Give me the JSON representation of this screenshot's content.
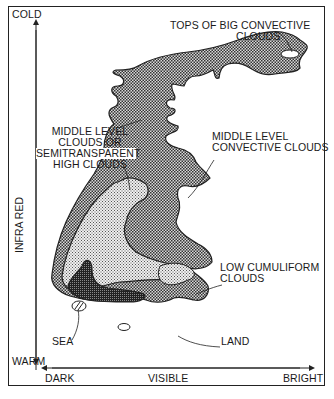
{
  "figure": {
    "axes": {
      "y_axis": {
        "label": "INFRA RED",
        "top": "COLD",
        "bottom": "WARM"
      },
      "x_axis": {
        "label": "VISIBLE",
        "left": "DARK",
        "right": "BRIGHT"
      }
    },
    "regions": [
      {
        "id": "tops",
        "label": "TOPS OF BIG CONVECTIVE\nCLOUDS",
        "line1": "TOPS OF BIG CONVECTIVE",
        "line2": "CLOUDS"
      },
      {
        "id": "mid-semi",
        "line1": "MIDDLE LEVEL",
        "line2": "CLOUDS OR",
        "line3": "SEMITRANSPARENT",
        "line4": "HIGH CLOUDS"
      },
      {
        "id": "mid-conv",
        "line1": "MIDDLE LEVEL",
        "line2": "CONVECTIVE CLOUDS"
      },
      {
        "id": "low-cum",
        "line1": "LOW CUMULIFORM",
        "line2": "CLOUDS"
      },
      {
        "id": "sea",
        "label": "SEA"
      },
      {
        "id": "land",
        "label": "LAND"
      }
    ],
    "colors": {
      "border": "#222222",
      "fill_dark": "#3a3a3a",
      "fill_mid": "#8c8c8c",
      "fill_light": "#c8c8c8"
    },
    "caption": ""
  }
}
